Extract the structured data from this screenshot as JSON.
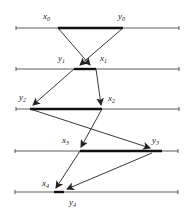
{
  "diagram": {
    "type": "iterative bracketing intervals",
    "colors": {
      "line": "#333333",
      "thick": "#111111",
      "arrow": "#222222",
      "background": "#ffffff"
    },
    "levels": [
      {
        "y": 28,
        "x_start": 16,
        "x_end": 179,
        "seg_start": 58,
        "seg_end": 123,
        "left_label": {
          "base": "x",
          "sub": "0",
          "x": 43,
          "y": 19
        },
        "right_label": {
          "base": "y",
          "sub": "0",
          "x": 118,
          "y": 19
        }
      },
      {
        "y": 69,
        "x_start": 16,
        "x_end": 179,
        "seg_start": 74,
        "seg_end": 96,
        "left_label": {
          "base": "y",
          "sub": "1",
          "x": 58,
          "y": 61
        },
        "right_label": {
          "base": "x",
          "sub": "1",
          "x": 100,
          "y": 61
        }
      },
      {
        "y": 109,
        "x_start": 16,
        "x_end": 179,
        "seg_start": 30,
        "seg_end": 102,
        "left_label": {
          "base": "y",
          "sub": "2",
          "x": 19,
          "y": 100
        },
        "right_label": {
          "base": "x",
          "sub": "2",
          "x": 108,
          "y": 101
        }
      },
      {
        "y": 151,
        "x_start": 15,
        "x_end": 178,
        "seg_start": 80,
        "seg_end": 162,
        "left_label": {
          "base": "x",
          "sub": "3",
          "x": 62,
          "y": 143
        },
        "right_label": {
          "base": "y",
          "sub": "3",
          "x": 152,
          "y": 143
        }
      },
      {
        "y": 192,
        "x_start": 15,
        "x_end": 178,
        "seg_start": 54,
        "seg_end": 64,
        "left_label": {
          "base": "x",
          "sub": "4",
          "x": 42,
          "y": 186
        },
        "right_label": {
          "base": "y",
          "sub": "4",
          "x": 69,
          "y": 205
        }
      }
    ],
    "arrows": [
      {
        "from": [
          58,
          28
        ],
        "to": [
          90,
          65
        ]
      },
      {
        "from": [
          123,
          28
        ],
        "to": [
          80,
          65
        ]
      },
      {
        "from": [
          74,
          69
        ],
        "to": [
          33,
          105
        ]
      },
      {
        "from": [
          96,
          69
        ],
        "to": [
          101,
          105
        ]
      },
      {
        "from": [
          30,
          109
        ],
        "to": [
          150,
          148
        ]
      },
      {
        "from": [
          102,
          109
        ],
        "to": [
          81,
          147
        ]
      },
      {
        "from": [
          80,
          151
        ],
        "to": [
          56,
          188
        ]
      },
      {
        "from": [
          152,
          153
        ],
        "to": [
          67,
          189
        ]
      }
    ]
  }
}
